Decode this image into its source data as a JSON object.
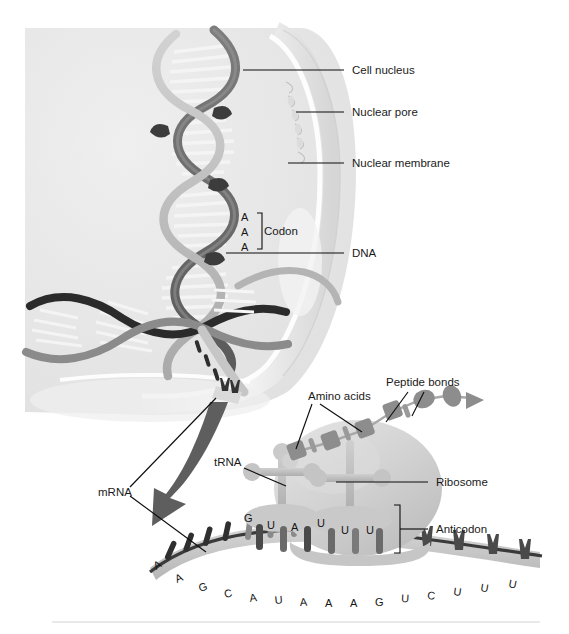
{
  "figure": {
    "background_color": "#ffffff"
  },
  "labels": {
    "cell_nucleus": "Cell nucleus",
    "nuclear_pore": "Nuclear pore",
    "nuclear_membrane": "Nuclear membrane",
    "dna": "DNA",
    "codon": "Codon",
    "mrna": "mRNA",
    "trna": "tRNA",
    "amino_acids": "Amino acids",
    "peptide_bonds": "Peptide bonds",
    "ribosome": "Ribosome",
    "anticodon": "Anticodon"
  },
  "codon_bases": [
    "A",
    "A",
    "A"
  ],
  "anticodon_bases_left": [
    "G",
    "U",
    "A"
  ],
  "anticodon_bases_right": [
    "U",
    "U",
    "U"
  ],
  "mrna_sequence": [
    "A",
    "A",
    "G",
    "C",
    "A",
    "U",
    "A",
    "A",
    "A",
    "G",
    "U",
    "C",
    "U",
    "U",
    "U"
  ],
  "colors": {
    "ink": "#1a1a1a",
    "leader_line": "#0d0d0d",
    "nucleus_fill": "#e8e8e8",
    "nucleus_edge": "#f7f7f7",
    "membrane": "#d8d8d8",
    "dna_strand_dark": "#4a4a4a",
    "dna_strand_mid": "#8f8f8f",
    "dna_strand_light": "#c9c9c9",
    "dna_rung": "#f2f2f2",
    "ribosome_fill": "#d2d2d2",
    "trna_fill": "#b8b8b8",
    "mrna_ribbon": "#c4c4c4",
    "mrna_backbone": "#3a3a3a",
    "amino_acid": "#909090",
    "arrow_dark": "#555555",
    "divider": "#e2e2e2"
  }
}
